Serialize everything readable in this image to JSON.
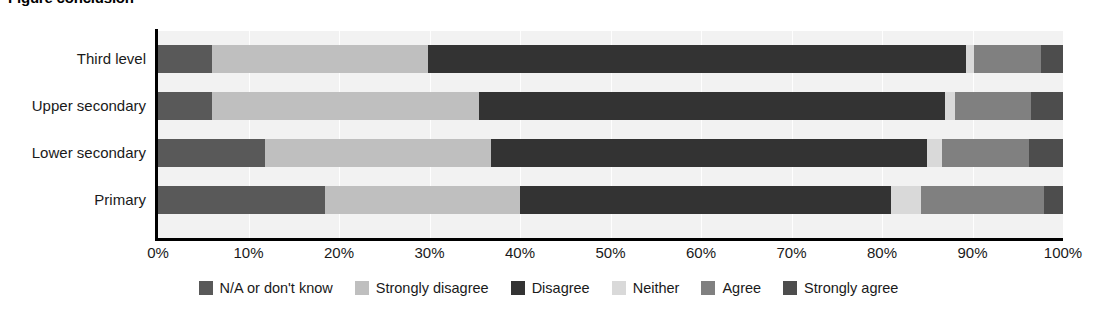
{
  "chart_data": {
    "type": "bar",
    "orientation": "horizontal",
    "stacked": true,
    "normalized": true,
    "title": "Figure conclusion",
    "xlabel": "",
    "ylabel": "",
    "xlim": [
      0,
      100
    ],
    "grid": true,
    "legend_position": "bottom",
    "categories": [
      "Third level",
      "Upper secondary",
      "Lower secondary",
      "Primary"
    ],
    "xticklabels": [
      "0%",
      "10%",
      "20%",
      "30%",
      "40%",
      "50%",
      "60%",
      "70%",
      "80%",
      "90%",
      "100%"
    ],
    "xtickvalues": [
      0,
      10,
      20,
      30,
      40,
      50,
      60,
      70,
      80,
      90,
      100
    ],
    "series": [
      {
        "name": "N/A or don't know",
        "color": "#595959",
        "values": [
          6.0,
          6.0,
          11.8,
          18.5
        ]
      },
      {
        "name": "Strongly disagree",
        "color": "#bfbfbf",
        "values": [
          23.8,
          29.5,
          25.0,
          21.5
        ]
      },
      {
        "name": "Disagree",
        "color": "#333333",
        "values": [
          59.5,
          51.5,
          48.2,
          41.0
        ]
      },
      {
        "name": "Neither",
        "color": "#d9d9d9",
        "values": [
          0.9,
          1.1,
          1.6,
          3.3
        ]
      },
      {
        "name": "Agree",
        "color": "#808080",
        "values": [
          7.4,
          8.4,
          9.6,
          13.6
        ]
      },
      {
        "name": "Strongly agree",
        "color": "#4d4d4d",
        "values": [
          2.4,
          3.5,
          3.8,
          2.1
        ]
      }
    ]
  },
  "colors": {
    "plot_background": "#f2f2f2",
    "axis": "#000000",
    "gridline": "#ffffff",
    "text": "#1a1a1a"
  }
}
